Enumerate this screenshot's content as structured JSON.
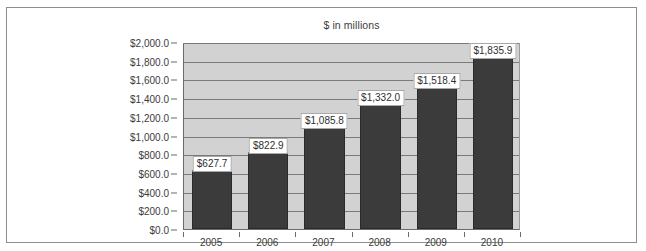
{
  "chart_data": {
    "type": "bar",
    "title": "$ in millions",
    "xlabel": "",
    "ylabel": "",
    "categories": [
      "2005",
      "2006",
      "2007",
      "2008",
      "2009",
      "2010"
    ],
    "values": [
      627.7,
      822.9,
      1085.8,
      1332.0,
      1518.4,
      1835.9
    ],
    "data_labels": [
      "$627.7",
      "$822.9",
      "$1,085.8",
      "$1,332.0",
      "$1,518.4",
      "$1,835.9"
    ],
    "ylim": [
      0,
      2000
    ],
    "ytick_step": 200,
    "ytick_labels": [
      "$2,000.0",
      "$1,800.0",
      "$1,600.0",
      "$1,400.0",
      "$1,200.0",
      "$1,000.0",
      "$800.0",
      "$600.0",
      "$400.0",
      "$200.0",
      "$0.0"
    ],
    "ytick_values": [
      2000,
      1800,
      1600,
      1400,
      1200,
      1000,
      800,
      600,
      400,
      200,
      0
    ],
    "grid": true,
    "legend": false,
    "colors": {
      "bar": "#3b3b3b",
      "plot_background": "#d2d2d2",
      "gridline": "#7a7a7a",
      "axis": "#6b6b6b",
      "frame": "#8d8d8d",
      "text": "#3c3c3c",
      "label_background": "#ffffff"
    }
  }
}
